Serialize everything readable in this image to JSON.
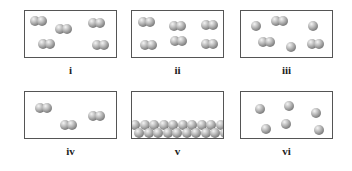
{
  "panels": [
    {
      "id": "i",
      "label": "i",
      "x": 24,
      "y": 10,
      "description": "diatomic molecules (gas of one element)",
      "atoms": [
        [
          5,
          5
        ],
        [
          12,
          5
        ],
        [
          30,
          13
        ],
        [
          37,
          13
        ],
        [
          63,
          7
        ],
        [
          70,
          7
        ],
        [
          13,
          28
        ],
        [
          20,
          28
        ],
        [
          67,
          29
        ],
        [
          74,
          29
        ]
      ]
    },
    {
      "id": "ii",
      "label": "ii",
      "x": 131,
      "y": 10,
      "description": "diatomic molecules",
      "atoms": [
        [
          6,
          6
        ],
        [
          13,
          6
        ],
        [
          37,
          10
        ],
        [
          44,
          10
        ],
        [
          69,
          9
        ],
        [
          76,
          9
        ],
        [
          8,
          29
        ],
        [
          15,
          29
        ],
        [
          38,
          25
        ],
        [
          45,
          25
        ],
        [
          69,
          28
        ],
        [
          76,
          28
        ]
      ]
    },
    {
      "id": "iii",
      "label": "iii",
      "x": 240,
      "y": 10,
      "description": "mixture of atoms and diatomic molecules",
      "atoms": [
        [
          10,
          10
        ],
        [
          30,
          5
        ],
        [
          37,
          5
        ],
        [
          67,
          10
        ],
        [
          17,
          26
        ],
        [
          24,
          26
        ],
        [
          45,
          31
        ],
        [
          66,
          28
        ],
        [
          73,
          28
        ]
      ]
    },
    {
      "id": "iv",
      "label": "iv",
      "x": 24,
      "y": 91,
      "description": "diatomic molecules",
      "atoms": [
        [
          10,
          11
        ],
        [
          17,
          11
        ],
        [
          35,
          28
        ],
        [
          42,
          28
        ],
        [
          63,
          19
        ],
        [
          70,
          19
        ]
      ]
    },
    {
      "id": "v",
      "label": "v",
      "x": 131,
      "y": 91,
      "description": "close-packed solid atoms at bottom",
      "rows": 2
    },
    {
      "id": "vi",
      "label": "vi",
      "x": 240,
      "y": 91,
      "description": "single atoms (monatomic gas)",
      "atoms": [
        [
          14,
          12
        ],
        [
          43,
          9
        ],
        [
          70,
          16
        ],
        [
          20,
          32
        ],
        [
          40,
          27
        ],
        [
          73,
          33
        ]
      ]
    }
  ]
}
